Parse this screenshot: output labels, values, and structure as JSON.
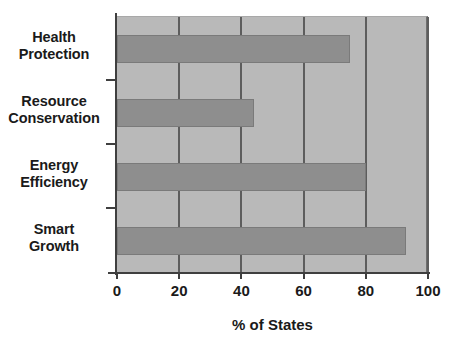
{
  "chart_data": {
    "type": "bar",
    "orientation": "horizontal",
    "title": "",
    "xlabel": "% of States",
    "ylabel": "",
    "categories": [
      "Smart Growth",
      "Energy Efficiency",
      "Resource Conservation",
      "Health Protection"
    ],
    "values": [
      93,
      80,
      44,
      75
    ],
    "xlim": [
      0,
      100
    ],
    "xticks": [
      0,
      20,
      40,
      60,
      80,
      100
    ],
    "xtick_labels": [
      "0",
      "20",
      "40",
      "60",
      "80",
      "100"
    ],
    "grid": true,
    "grid_axis": "x",
    "legend": null,
    "colors": {
      "bar_fill": "#8e8e8e",
      "bar_edge": "#7a7a7a",
      "plot_background": "#b9b9b9",
      "gridline": "#5d5d5d",
      "axis": "#3f3f3f",
      "text": "#1a1a1a",
      "page_background": "#ffffff"
    }
  },
  "category_labels": [
    {
      "line1": "Health",
      "line2": "Protection"
    },
    {
      "line1": "Resource",
      "line2": "Conservation"
    },
    {
      "line1": "Energy",
      "line2": "Efficiency"
    },
    {
      "line1": "Smart",
      "line2": "Growth"
    }
  ]
}
